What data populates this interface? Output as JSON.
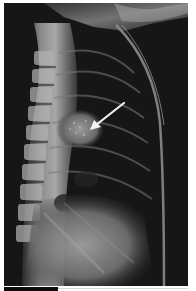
{
  "figure": {
    "type": "lateral chest radiograph",
    "panel_label": "A",
    "annotation": {
      "kind": "arrow",
      "color": "#f2f2f2",
      "from": [
        124,
        103
      ],
      "to": [
        91,
        130
      ],
      "points_to": "rounded opacity with speckled calcification overlying the posterior mediastinum"
    },
    "colors": {
      "background": "#ffffff",
      "film_dark": "#151515",
      "bone_light": "#c8c8c8"
    }
  }
}
